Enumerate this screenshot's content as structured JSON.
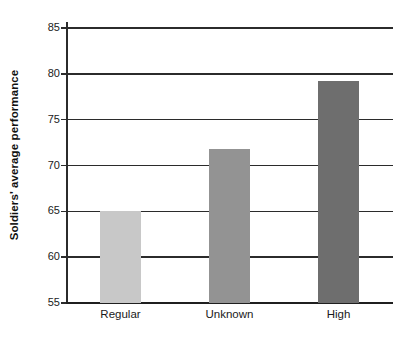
{
  "chart_data": {
    "type": "bar",
    "title": "",
    "subtitle": "",
    "xlabel": "",
    "ylabel": "Soldiers' average performance",
    "categories": [
      "Regular",
      "Unknown",
      "High"
    ],
    "values": [
      65.0,
      71.8,
      79.2
    ],
    "series": [
      {
        "name": "Soldiers' average performance",
        "values": [
          65.0,
          71.8,
          79.2
        ]
      }
    ],
    "bar_colors": [
      "#c8c8c8",
      "#939393",
      "#6e6e6e"
    ],
    "ylim": [
      55,
      85
    ],
    "yticks": [
      55,
      60,
      65,
      70,
      75,
      80,
      85
    ],
    "ytick_labels": [
      "55",
      "60",
      "65",
      "70",
      "75",
      "80",
      "85"
    ],
    "grid": true,
    "grid_axis": "y",
    "legend": false,
    "legend_position": "none",
    "annotations": [],
    "axis_color": "#2b2b2b",
    "background_color": "#ffffff"
  }
}
